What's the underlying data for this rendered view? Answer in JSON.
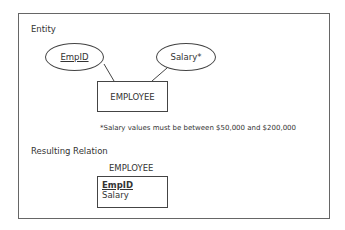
{
  "entity_section": {
    "heading": "Entity",
    "attributes": [
      {
        "name": "EmpID",
        "is_key": true
      },
      {
        "name": "Salary*",
        "is_key": false
      }
    ],
    "entity_name": "EMPLOYEE",
    "footnote": "*Salary values must be between $50,000 and $200,000"
  },
  "relation_section": {
    "heading": "Resulting Relation",
    "relation_name": "EMPLOYEE",
    "fields": [
      {
        "name": "EmpID",
        "is_primary_key": true
      },
      {
        "name": "Salary",
        "is_primary_key": false
      }
    ]
  }
}
